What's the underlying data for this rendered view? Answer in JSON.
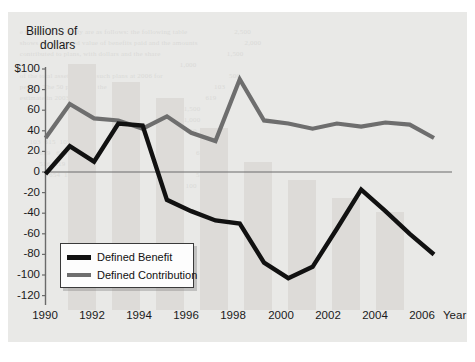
{
  "chart_data": {
    "type": "line",
    "title": "",
    "ylabel_line1": "Billions of",
    "ylabel_line2": "dollars",
    "xlabel": "Year",
    "x": [
      1990,
      1991,
      1992,
      1993,
      1994,
      1995,
      1996,
      1997,
      1998,
      1999,
      2000,
      2001,
      2002,
      2003,
      2004,
      2005,
      2006
    ],
    "xtick_labels": [
      "1990",
      "1992",
      "1994",
      "1996",
      "1998",
      "2000",
      "2002",
      "2004",
      "2006"
    ],
    "xtick_values": [
      1990,
      1992,
      1994,
      1996,
      1998,
      2000,
      2002,
      2004,
      2006
    ],
    "xlim": [
      1990,
      2006
    ],
    "ytick_labels": [
      "$100",
      "80",
      "60",
      "40",
      "20",
      "0",
      "-20",
      "-40",
      "-60",
      "-80",
      "-100",
      "-120"
    ],
    "ytick_values": [
      100,
      80,
      60,
      40,
      20,
      0,
      -20,
      -40,
      -60,
      -80,
      -100,
      -120
    ],
    "ylim": [
      -120,
      100
    ],
    "grid": false,
    "legend_position": "lower-left-inside",
    "series": [
      {
        "name": "Defined Benefit",
        "color": "#111111",
        "values": [
          -2,
          25,
          10,
          47,
          45,
          -27,
          -38,
          -47,
          -50,
          -88,
          -103,
          -92,
          -55,
          -17,
          -38,
          -60,
          -80
        ]
      },
      {
        "name": "Defined Contribution",
        "color": "#6e6e6e",
        "values": [
          33,
          66,
          52,
          50,
          42,
          54,
          38,
          30,
          90,
          50,
          47,
          42,
          47,
          44,
          48,
          46,
          33
        ]
      }
    ]
  },
  "legend": {
    "items": [
      {
        "label": "Defined Benefit",
        "color": "#111111"
      },
      {
        "label": "Defined Contribution",
        "color": "#6e6e6e"
      }
    ]
  },
  "background_ghost_text": "                                                                                                         \n   e results of our study are as follows: the following table                        2,500\n   shows the estimated value of benefits paid and the amounts                        2,000\n   contributed to plans, with dollars and the share                                  1,500\n                                                                                     1,000\n   of the total assets held in such plans at 2006 for                                  500\n   period. The 50 percent of the                                                       103\n   estimate in 2003 that                                                               619\n                                                                                       1,500\n                                                                                       1,000\n                                                                                        500\n        103  615  105                                                                   100\n             619   618                                                                  654\n             516  319  518                                                              916\n                  654  103                                                              519\n                                                                                        100"
}
